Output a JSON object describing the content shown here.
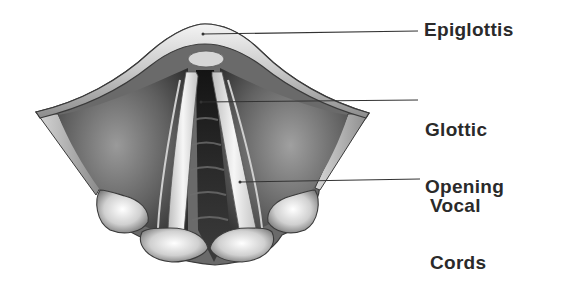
{
  "figure": {
    "labels": [
      {
        "id": "epiglottis",
        "lines": [
          "Epiglottis"
        ]
      },
      {
        "id": "glottic-opening",
        "lines": [
          "Glottic",
          "Opening"
        ]
      },
      {
        "id": "vocal-cords",
        "lines": [
          "Vocal",
          "Cords"
        ]
      }
    ]
  },
  "labels": {
    "epiglottis": "Epiglottis",
    "glottic_line1": "Glottic",
    "glottic_line2": "Opening",
    "vocal_line1": "Vocal",
    "vocal_line2": "Cords"
  },
  "colors": {
    "background": "#ffffff",
    "text": "#2a2a2a",
    "leader_line": "#333333",
    "outline": "#3a3a3a",
    "tissue_dark": "#4a4a4a",
    "tissue_mid": "#8a8a8a",
    "tissue_light": "#e8e8e8",
    "airway": "#1e1e1e"
  }
}
